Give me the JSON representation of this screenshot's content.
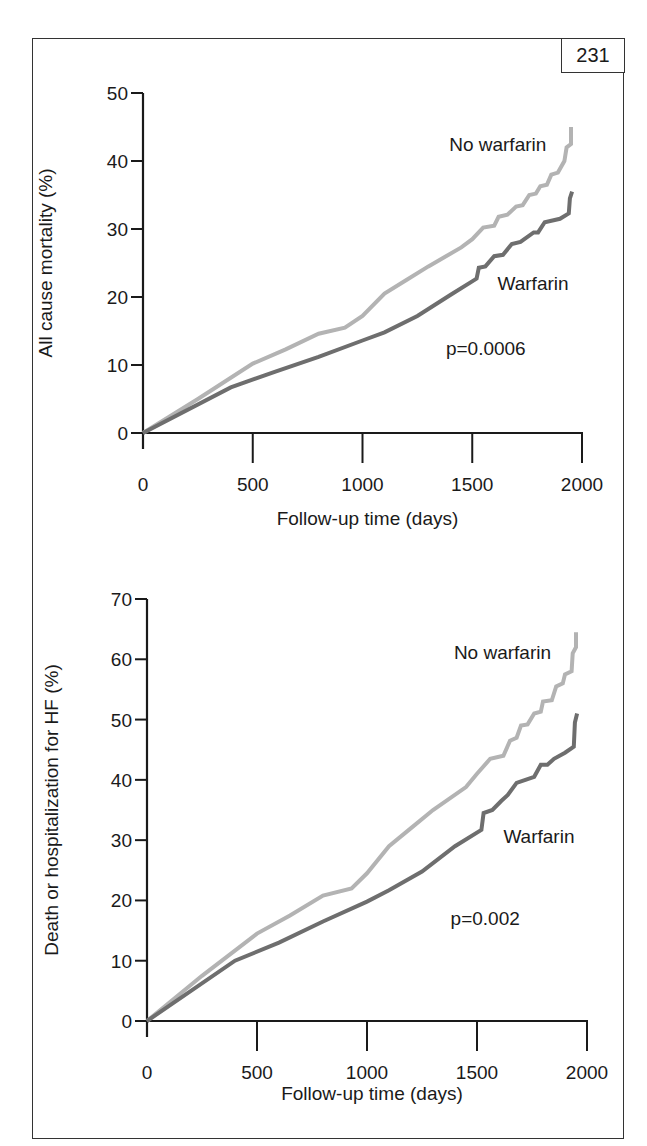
{
  "page": {
    "number": "231"
  },
  "colors": {
    "no_warfarin": "#b3b3b3",
    "warfarin": "#6e6e6e",
    "axis": "#1a1a1a",
    "frame": "#333333"
  },
  "chart_data": [
    {
      "type": "line",
      "title": "",
      "xlabel": "Follow-up time (days)",
      "ylabel": "All cause mortality (%)",
      "xlim": [
        0,
        2000
      ],
      "ylim": [
        0,
        50
      ],
      "xticks": [
        0,
        500,
        1000,
        1500,
        2000
      ],
      "xtick_labels": [
        "0",
        "500",
        "1000",
        "1500",
        "2000"
      ],
      "yticks": [
        0,
        10,
        20,
        30,
        40,
        50
      ],
      "ytick_labels": [
        "0",
        "10",
        "20",
        "30",
        "40",
        "50"
      ],
      "grid": false,
      "legend": "inline labels",
      "annotations": [
        {
          "text": "p=0.0006",
          "x": 1380,
          "y": 11.5
        }
      ],
      "series": [
        {
          "name": "No warfarin",
          "label_pos": {
            "x": 1395,
            "y": 41.5
          },
          "x": [
            0,
            250,
            500,
            650,
            800,
            920,
            1000,
            1100,
            1200,
            1300,
            1450,
            1500,
            1550,
            1600,
            1620,
            1660,
            1700,
            1730,
            1760,
            1790,
            1810,
            1840,
            1860,
            1890,
            1920,
            1930,
            1950,
            1950
          ],
          "y": [
            0,
            5,
            10.2,
            12.3,
            14.6,
            15.5,
            17.2,
            20.5,
            22.5,
            24.5,
            27.3,
            28.5,
            30.2,
            30.5,
            31.8,
            32.1,
            33.3,
            33.5,
            35,
            35.2,
            36.3,
            36.5,
            38,
            38.3,
            40,
            42,
            42.5,
            45
          ]
        },
        {
          "name": "Warfarin",
          "label_pos": {
            "x": 1615,
            "y": 21
          },
          "x": [
            0,
            400,
            600,
            800,
            1000,
            1100,
            1250,
            1400,
            1520,
            1530,
            1560,
            1600,
            1640,
            1680,
            1720,
            1780,
            1800,
            1830,
            1900,
            1940,
            1945,
            1955
          ],
          "y": [
            0,
            6.7,
            9,
            11.2,
            13.6,
            14.8,
            17.2,
            20.3,
            22.7,
            24.3,
            24.5,
            26,
            26.2,
            27.8,
            28.1,
            29.5,
            29.5,
            31,
            31.5,
            32.3,
            34.5,
            35.5
          ]
        }
      ]
    },
    {
      "type": "line",
      "title": "",
      "xlabel": "Follow-up time (days)",
      "ylabel": "Death or hospitalization for HF (%)",
      "xlim": [
        0,
        2000
      ],
      "ylim": [
        0,
        70
      ],
      "xticks": [
        0,
        500,
        1000,
        1500,
        2000
      ],
      "xtick_labels": [
        "0",
        "500",
        "1000",
        "1500",
        "2000"
      ],
      "yticks": [
        0,
        10,
        20,
        30,
        40,
        50,
        60,
        70
      ],
      "ytick_labels": [
        "0",
        "10",
        "20",
        "30",
        "40",
        "50",
        "60",
        "70"
      ],
      "grid": false,
      "legend": "inline labels",
      "annotations": [
        {
          "text": "p=0.002",
          "x": 1380,
          "y": 16
        }
      ],
      "series": [
        {
          "name": "No warfarin",
          "label_pos": {
            "x": 1395,
            "y": 60
          },
          "x": [
            0,
            250,
            500,
            650,
            800,
            930,
            1000,
            1100,
            1200,
            1300,
            1450,
            1500,
            1560,
            1620,
            1650,
            1680,
            1700,
            1730,
            1760,
            1790,
            1800,
            1840,
            1860,
            1890,
            1900,
            1930,
            1935,
            1950,
            1950
          ],
          "y": [
            0,
            7.5,
            14.5,
            17.5,
            20.8,
            22,
            24.5,
            29,
            32,
            35,
            38.8,
            41,
            43.5,
            44,
            46.5,
            47,
            49,
            49.2,
            51,
            51.3,
            53,
            53.2,
            55.5,
            56,
            57.5,
            58,
            61,
            62,
            64.5
          ]
        },
        {
          "name": "Warfarin",
          "label_pos": {
            "x": 1620,
            "y": 29.5
          },
          "x": [
            0,
            400,
            600,
            800,
            1000,
            1100,
            1250,
            1400,
            1520,
            1530,
            1570,
            1610,
            1640,
            1680,
            1720,
            1760,
            1790,
            1820,
            1850,
            1900,
            1940,
            1945,
            1955
          ],
          "y": [
            0,
            10,
            13,
            16.5,
            19.8,
            21.7,
            24.8,
            29,
            31.7,
            34.5,
            35,
            36.5,
            37.5,
            39.5,
            40,
            40.5,
            42.5,
            42.5,
            43.5,
            44.5,
            45.5,
            49.5,
            51
          ]
        }
      ]
    }
  ]
}
